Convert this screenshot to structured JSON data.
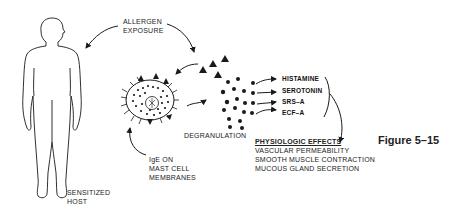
{
  "figure": {
    "caption": "Figure 5–15"
  },
  "labels": {
    "allergen_exposure": [
      "ALLERGEN",
      "EXPOSURE"
    ],
    "sensitized_host": [
      "SENSITIZED",
      "HOST"
    ],
    "ige": [
      "IgE ON",
      "MAST CELL",
      "MEMBRANES"
    ],
    "degranulation": "DEGRANULATION"
  },
  "mediators": [
    "HISTAMINE",
    "SEROTONIN",
    "SRS–A",
    "ECF–A"
  ],
  "physiologic_effects": {
    "title": "PHYSIOLOGIC  EFFECTS",
    "items": [
      "VASCULAR PERMEABILITY",
      "SMOOTH MUSCLE CONTRACTION",
      "MUCOUS GLAND  SECRETION"
    ]
  },
  "colors": {
    "ink": "#1a1a1a",
    "background": "#ffffff"
  }
}
